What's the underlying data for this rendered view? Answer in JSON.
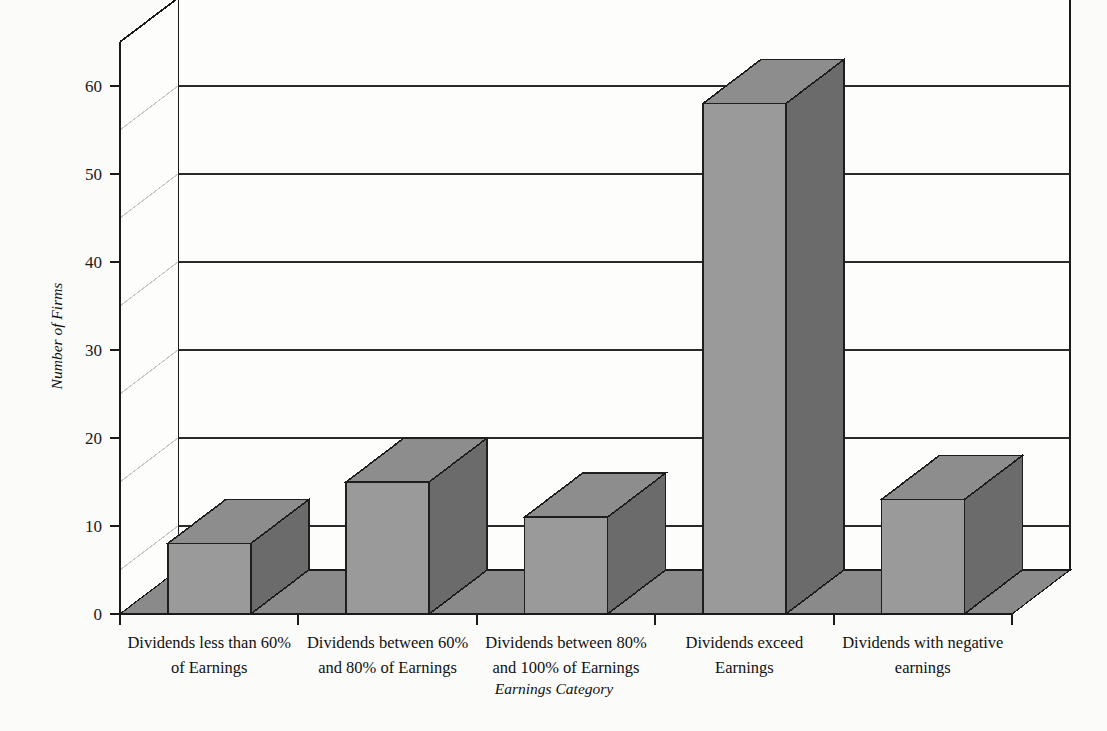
{
  "chart_data": {
    "type": "bar",
    "title": "",
    "subtitle": "",
    "xlabel": "Earnings Category",
    "ylabel": "Number of Firms",
    "categories": [
      "Dividends less than 60% of Earnings",
      "Dividends between 60% and 80% of Earnings",
      "Dividends between 80% and 100% of Earnings",
      "Dividends exceed Earnings",
      "Dividends with negative earnings"
    ],
    "category_lines": [
      [
        "Dividends less than 60%",
        "of Earnings"
      ],
      [
        "Dividends between 60%",
        "and 80% of Earnings"
      ],
      [
        "Dividends between 80%",
        "and 100% of Earnings"
      ],
      [
        "Dividends exceed",
        "Earnings"
      ],
      [
        "Dividends with negative",
        "earnings"
      ]
    ],
    "values": [
      8,
      15,
      11,
      58,
      13
    ],
    "ylim": [
      0,
      65
    ],
    "ytick_values": [
      0,
      10,
      20,
      30,
      40,
      50,
      60
    ],
    "ytick_labels": [
      "0",
      "10",
      "20",
      "30",
      "40",
      "50",
      "60"
    ],
    "gridline_values": [
      5,
      15,
      25,
      35,
      45,
      55
    ],
    "grid": true,
    "legend": false,
    "legend_position": "none",
    "three_d": true,
    "colors": {
      "bar_front": "#9a9a9a",
      "bar_top": "#8d8d8d",
      "bar_side": "#6b6b6b",
      "bar_outline": "#1e1e1e",
      "floor": "#8a8a8a",
      "wall": "#fdfdfb",
      "axis": "#1a1a1a",
      "grid": "#2a2a2a",
      "grid_side": "#c9c9c9",
      "background": "#fbfbf9"
    }
  }
}
